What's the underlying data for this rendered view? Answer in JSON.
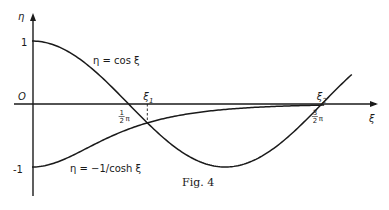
{
  "chart_data": {
    "type": "line",
    "title": "",
    "caption": "Fig. 4",
    "xlabel": "ξ",
    "ylabel": "η",
    "xlim": [
      0,
      5.3
    ],
    "ylim": [
      -1.45,
      1.45
    ],
    "grid": false,
    "origin_label": "O",
    "y_ticks": [
      {
        "value": 1,
        "label": "1"
      },
      {
        "value": -1,
        "label": "-1"
      }
    ],
    "x_ticks": [
      {
        "value": 1.5708,
        "label_num": "1",
        "label_den": "2",
        "label_sym": "π"
      },
      {
        "value": 4.7124,
        "label_num": "3",
        "label_den": "2",
        "label_sym": "π"
      }
    ],
    "series": [
      {
        "name": "η = cos ξ",
        "function": "cos",
        "x_range": [
          0,
          5.2
        ]
      },
      {
        "name": "η = −1/cosh ξ",
        "function": "neg_sech",
        "x_range": [
          0,
          4.75
        ]
      }
    ],
    "annotations": [
      {
        "label": "ξ",
        "sub": "1",
        "x": 1.875,
        "y": -0.3,
        "dashed_drop": true
      },
      {
        "label": "ξ",
        "sub": "2",
        "x": 4.694,
        "y": -0.018,
        "dashed_drop": false
      }
    ],
    "curve_labels": [
      {
        "text": "η = cos ξ",
        "series": 0
      },
      {
        "text": "η = −1/cosh ξ",
        "series": 1
      }
    ]
  }
}
